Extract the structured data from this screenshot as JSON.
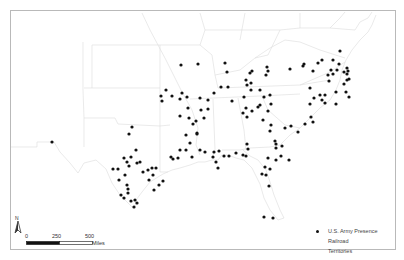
{
  "map": {
    "title": "",
    "region": "Southeastern United States",
    "frame_color": "#b9b9b9",
    "point_color": "#111111",
    "boundary_color": "#dcdcdc"
  },
  "legend": {
    "items": [
      {
        "label": "U.S. Army Presence",
        "symbol": "dot"
      },
      {
        "label": "Railroad",
        "symbol": "none"
      },
      {
        "label": "Territories",
        "symbol": "none"
      }
    ]
  },
  "north_arrow": {
    "label": "N"
  },
  "scale_bar": {
    "ticks": [
      "0",
      "250",
      "500"
    ],
    "unit": "Miles"
  },
  "points": [
    [
      52,
      142
    ],
    [
      132,
      127
    ],
    [
      129,
      134
    ],
    [
      136,
      150
    ],
    [
      124,
      158
    ],
    [
      119,
      180
    ],
    [
      127,
      185
    ],
    [
      128,
      193
    ],
    [
      121,
      195
    ],
    [
      124,
      198
    ],
    [
      135,
      200
    ],
    [
      137,
      203
    ],
    [
      131,
      201
    ],
    [
      134,
      207
    ],
    [
      128,
      189
    ],
    [
      118,
      169
    ],
    [
      113,
      169
    ],
    [
      125,
      175
    ],
    [
      127,
      162
    ],
    [
      129,
      166
    ],
    [
      131,
      157
    ],
    [
      137,
      163
    ],
    [
      140,
      162
    ],
    [
      143,
      172
    ],
    [
      148,
      170
    ],
    [
      149,
      180
    ],
    [
      152,
      168
    ],
    [
      153,
      175
    ],
    [
      156,
      168
    ],
    [
      154,
      190
    ],
    [
      159,
      185
    ],
    [
      163,
      181
    ],
    [
      161,
      96
    ],
    [
      162,
      101
    ],
    [
      166,
      90
    ],
    [
      172,
      96
    ],
    [
      180,
      99
    ],
    [
      182,
      93
    ],
    [
      187,
      97
    ],
    [
      188,
      108
    ],
    [
      180,
      116
    ],
    [
      189,
      118
    ],
    [
      193,
      124
    ],
    [
      197,
      133
    ],
    [
      196,
      121
    ],
    [
      204,
      118
    ],
    [
      201,
      110
    ],
    [
      200,
      98
    ],
    [
      208,
      100
    ],
    [
      208,
      109
    ],
    [
      214,
      93
    ],
    [
      221,
      87
    ],
    [
      228,
      87
    ],
    [
      232,
      101
    ],
    [
      243,
      113
    ],
    [
      247,
      85
    ],
    [
      251,
      90
    ],
    [
      251,
      83
    ],
    [
      260,
      90
    ],
    [
      264,
      97
    ],
    [
      271,
      104
    ],
    [
      181,
      65
    ],
    [
      198,
      64
    ],
    [
      225,
      63
    ],
    [
      227,
      72
    ],
    [
      250,
      73
    ],
    [
      246,
      80
    ],
    [
      244,
      97
    ],
    [
      252,
      71
    ],
    [
      266,
      75
    ],
    [
      268,
      71
    ],
    [
      267,
      67
    ],
    [
      290,
      69
    ],
    [
      304,
      64
    ],
    [
      303,
      66
    ],
    [
      270,
      95
    ],
    [
      268,
      111
    ],
    [
      260,
      105
    ],
    [
      246,
      108
    ],
    [
      252,
      111
    ],
    [
      247,
      117
    ],
    [
      186,
      135
    ],
    [
      197,
      134
    ],
    [
      190,
      143
    ],
    [
      186,
      150
    ],
    [
      180,
      150
    ],
    [
      171,
      157
    ],
    [
      173,
      159
    ],
    [
      178,
      158
    ],
    [
      192,
      157
    ],
    [
      200,
      150
    ],
    [
      205,
      152
    ],
    [
      214,
      152
    ],
    [
      219,
      151
    ],
    [
      216,
      162
    ],
    [
      218,
      168
    ],
    [
      213,
      157
    ],
    [
      224,
      156
    ],
    [
      229,
      156
    ],
    [
      236,
      153
    ],
    [
      243,
      155
    ],
    [
      246,
      156
    ],
    [
      248,
      149
    ],
    [
      247,
      144
    ],
    [
      258,
      107
    ],
    [
      263,
      120
    ],
    [
      271,
      125
    ],
    [
      270,
      131
    ],
    [
      275,
      141
    ],
    [
      282,
      146
    ],
    [
      285,
      128
    ],
    [
      291,
      126
    ],
    [
      298,
      132
    ],
    [
      305,
      124
    ],
    [
      311,
      117
    ],
    [
      313,
      122
    ],
    [
      310,
      104
    ],
    [
      314,
      98
    ],
    [
      320,
      95
    ],
    [
      328,
      75
    ],
    [
      333,
      74
    ],
    [
      337,
      70
    ],
    [
      347,
      68
    ],
    [
      348,
      71
    ],
    [
      349,
      79
    ],
    [
      344,
      84
    ],
    [
      325,
      103
    ],
    [
      329,
      81
    ],
    [
      331,
      70
    ],
    [
      318,
      63
    ],
    [
      322,
      60
    ],
    [
      333,
      60
    ],
    [
      339,
      64
    ],
    [
      340,
      51
    ],
    [
      313,
      71
    ],
    [
      322,
      100
    ],
    [
      325,
      95
    ],
    [
      336,
      92
    ],
    [
      336,
      104
    ],
    [
      349,
      97
    ],
    [
      346,
      92
    ],
    [
      347,
      74
    ],
    [
      347,
      80
    ],
    [
      344,
      72
    ],
    [
      281,
      156
    ],
    [
      276,
      160
    ],
    [
      268,
      158
    ],
    [
      270,
      169
    ],
    [
      266,
      175
    ],
    [
      262,
      174
    ],
    [
      265,
      167
    ],
    [
      269,
      186
    ],
    [
      276,
      148
    ],
    [
      276,
      144
    ],
    [
      289,
      160
    ],
    [
      264,
      217
    ],
    [
      273,
      218
    ],
    [
      310,
      88
    ]
  ]
}
